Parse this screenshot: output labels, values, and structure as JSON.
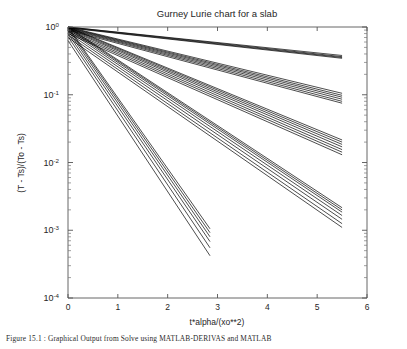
{
  "figure": {
    "title": "Gurney Lurie chart for a slab",
    "xlabel": "t*alpha/(xo**2)",
    "ylabel": "(T - Ts)/(To - Ts)",
    "background": "#ffffff",
    "line_color": "#000000",
    "axis_color": "#4d4d4d"
  },
  "caption": {
    "text": "Figure 15.1 : Graphical Output from Solve using MATLAB-DERIVAS and MATLAB"
  },
  "axes": {
    "x_ticks": [
      "0",
      "1",
      "2",
      "3",
      "4",
      "5",
      "6"
    ],
    "x_tick_values": [
      0,
      1,
      2,
      3,
      4,
      5,
      6
    ],
    "y_ticks": [
      "10^0",
      "10^-1",
      "10^-2",
      "10^-3",
      "10^-4"
    ],
    "y_tick_exponents": [
      0,
      -1,
      -2,
      -3,
      -4
    ],
    "y_tick_mantissa": [
      "10",
      "10",
      "10",
      "10",
      "10"
    ],
    "y_tick_sup": [
      "0",
      "-1",
      "-2",
      "-3",
      "-4"
    ]
  },
  "chart_data": {
    "type": "line",
    "title": "Gurney Lurie chart for a slab",
    "xlabel": "t*alpha/(xo**2)",
    "ylabel": "(T - Ts)/(To - Ts)",
    "xlim": [
      0,
      6
    ],
    "ylim": [
      0.0001,
      1
    ],
    "yscale": "log",
    "xscale": "linear",
    "grid": false,
    "legend": "none",
    "xticks": [
      0,
      1,
      2,
      3,
      4,
      5,
      6
    ],
    "yticks": [
      0.0001,
      0.001,
      0.01,
      0.1,
      1
    ],
    "note": "Each series is the dimensionless temperature decay (T-Ts)/(To-Ts) versus Fourier number for one Biot-number / position combination; on a semilog axis each is essentially a straight decaying exponential fanning out from (0, 1).",
    "series": [
      {
        "name": "curve-01",
        "x": [
          0,
          5.5
        ],
        "y": [
          1.0,
          0.38
        ]
      },
      {
        "name": "curve-02",
        "x": [
          0,
          5.5
        ],
        "y": [
          1.0,
          0.365
        ]
      },
      {
        "name": "curve-03",
        "x": [
          0,
          5.5
        ],
        "y": [
          0.98,
          0.355
        ]
      },
      {
        "name": "curve-04",
        "x": [
          0,
          5.5
        ],
        "y": [
          0.97,
          0.345
        ]
      },
      {
        "name": "curve-05",
        "x": [
          0,
          5.5
        ],
        "y": [
          1.0,
          0.105
        ]
      },
      {
        "name": "curve-06",
        "x": [
          0,
          5.5
        ],
        "y": [
          0.985,
          0.098
        ]
      },
      {
        "name": "curve-07",
        "x": [
          0,
          5.5
        ],
        "y": [
          0.97,
          0.092
        ]
      },
      {
        "name": "curve-08",
        "x": [
          0,
          5.5
        ],
        "y": [
          0.95,
          0.086
        ]
      },
      {
        "name": "curve-09",
        "x": [
          0,
          5.5
        ],
        "y": [
          0.93,
          0.08
        ]
      },
      {
        "name": "curve-10",
        "x": [
          0,
          5.5
        ],
        "y": [
          0.9,
          0.075
        ]
      },
      {
        "name": "curve-11",
        "x": [
          0,
          5.5
        ],
        "y": [
          1.0,
          0.0215
        ]
      },
      {
        "name": "curve-12",
        "x": [
          0,
          5.5
        ],
        "y": [
          0.98,
          0.02
        ]
      },
      {
        "name": "curve-13",
        "x": [
          0,
          5.5
        ],
        "y": [
          0.95,
          0.0185
        ]
      },
      {
        "name": "curve-14",
        "x": [
          0,
          5.5
        ],
        "y": [
          0.92,
          0.017
        ]
      },
      {
        "name": "curve-15",
        "x": [
          0,
          5.5
        ],
        "y": [
          0.88,
          0.0155
        ]
      },
      {
        "name": "curve-16",
        "x": [
          0,
          5.5
        ],
        "y": [
          0.84,
          0.0142
        ]
      },
      {
        "name": "curve-17",
        "x": [
          0,
          5.5
        ],
        "y": [
          0.8,
          0.013
        ]
      },
      {
        "name": "curve-18",
        "x": [
          0,
          5.5
        ],
        "y": [
          1.0,
          0.00215
        ]
      },
      {
        "name": "curve-19",
        "x": [
          0,
          5.5
        ],
        "y": [
          0.97,
          0.002
        ]
      },
      {
        "name": "curve-20",
        "x": [
          0,
          5.5
        ],
        "y": [
          0.93,
          0.00185
        ]
      },
      {
        "name": "curve-21",
        "x": [
          0,
          5.5
        ],
        "y": [
          0.88,
          0.00165
        ]
      },
      {
        "name": "curve-22",
        "x": [
          0,
          5.5
        ],
        "y": [
          0.82,
          0.00145
        ]
      },
      {
        "name": "curve-23",
        "x": [
          0,
          5.5
        ],
        "y": [
          0.76,
          0.00125
        ]
      },
      {
        "name": "curve-24",
        "x": [
          0,
          5.5
        ],
        "y": [
          0.7,
          0.0011
        ]
      },
      {
        "name": "curve-25",
        "x": [
          0,
          2.85
        ],
        "y": [
          1.0,
          0.00105
        ]
      },
      {
        "name": "curve-26",
        "x": [
          0,
          2.85
        ],
        "y": [
          0.95,
          0.00092
        ]
      },
      {
        "name": "curve-27",
        "x": [
          0,
          2.85
        ],
        "y": [
          0.88,
          0.0008
        ]
      },
      {
        "name": "curve-28",
        "x": [
          0,
          2.85
        ],
        "y": [
          0.8,
          0.00068
        ]
      },
      {
        "name": "curve-29",
        "x": [
          0,
          2.85
        ],
        "y": [
          0.72,
          0.00055
        ]
      },
      {
        "name": "curve-30",
        "x": [
          0,
          2.85
        ],
        "y": [
          0.63,
          0.00042
        ]
      }
    ]
  }
}
